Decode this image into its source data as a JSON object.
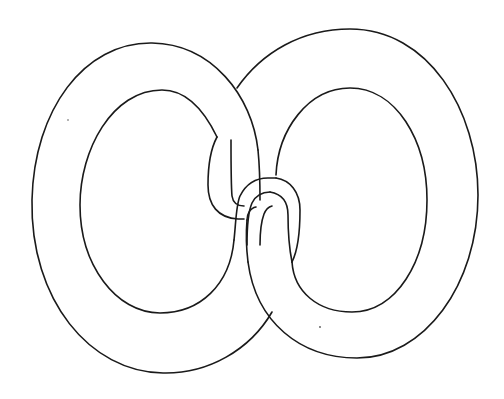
{
  "figure": {
    "title": "Two interlocking chain links",
    "colors": {
      "background": "#ffffff",
      "stroke": "#1a1a1a"
    },
    "links": [
      {
        "name": "left-link",
        "outer_bounds": {
          "left": 32,
          "top": 43,
          "right": 260,
          "bottom": 373
        },
        "inner_bounds": {
          "left": 80,
          "top": 90,
          "right": 233,
          "bottom": 313
        }
      },
      {
        "name": "right-link",
        "outer_bounds": {
          "left": 247,
          "top": 29,
          "right": 478,
          "bottom": 358
        },
        "inner_bounds": {
          "left": 276,
          "top": 88,
          "right": 427,
          "bottom": 312
        }
      }
    ]
  }
}
